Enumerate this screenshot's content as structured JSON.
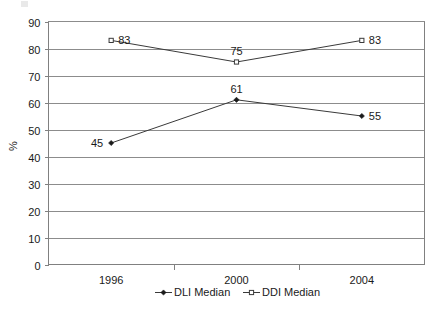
{
  "chart_data": {
    "type": "line",
    "title": "",
    "xlabel": "",
    "ylabel": "%",
    "categories": [
      "1996",
      "2000",
      "2004"
    ],
    "ylim": [
      0,
      90
    ],
    "ytick_step": 10,
    "yticks": [
      "0",
      "10",
      "20",
      "30",
      "40",
      "50",
      "60",
      "70",
      "80",
      "90"
    ],
    "grid": true,
    "legend_position": "bottom",
    "series": [
      {
        "name": "DLI Median",
        "marker": "filled-diamond",
        "values": [
          45,
          61,
          55
        ],
        "point_labels": [
          "45",
          "61",
          "55"
        ],
        "label_positions": [
          "left",
          "above",
          "right"
        ]
      },
      {
        "name": "DDI Median",
        "marker": "open-square",
        "values": [
          83,
          75,
          83
        ],
        "point_labels": [
          "83",
          "75",
          "83"
        ],
        "label_positions": [
          "right",
          "above",
          "right"
        ]
      }
    ],
    "colors": {
      "series_line": "#3a3a3a",
      "grid": "#8c8c8c",
      "axis": "#808080",
      "text": "#1a1a1a",
      "background": "#ffffff"
    }
  },
  "legend": {
    "items": [
      {
        "label": "DLI Median",
        "marker": "filled-diamond"
      },
      {
        "label": "DDI Median",
        "marker": "open-square"
      }
    ]
  }
}
